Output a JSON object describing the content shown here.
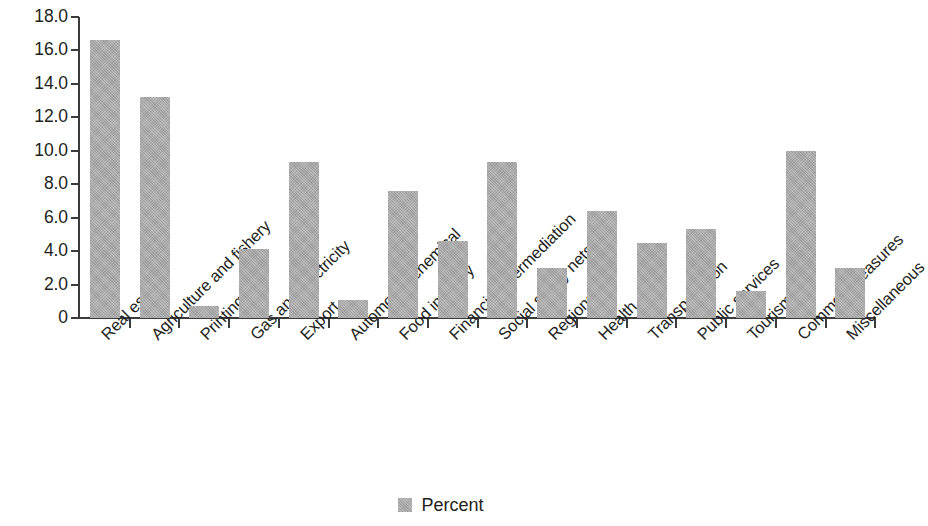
{
  "chart_data": {
    "type": "bar",
    "title": "",
    "subtitle": "",
    "xlabel": "",
    "ylabel": "",
    "ylim": [
      0,
      18
    ],
    "ytick_step": 2,
    "grid": false,
    "legend_position": "bottom-center",
    "bar_color": "#a9a9a9",
    "axis_color": "#3b3b3b",
    "text_color": "#231f20",
    "categories": [
      "Real estate",
      "Agriculture and fishery",
      "Printing",
      "Gas and electricity",
      "Export",
      "Automobile/chemical",
      "Food industry",
      "Financial intermediation",
      "Social safety nets",
      "Regions",
      "Health",
      "Transportation",
      "Public services",
      "Tourism",
      "Common measures",
      "Miscellaneous"
    ],
    "series": [
      {
        "name": "Percent",
        "values": [
          16.6,
          13.2,
          0.7,
          4.1,
          9.3,
          1.1,
          7.6,
          4.6,
          9.3,
          3.0,
          6.4,
          4.5,
          5.3,
          1.6,
          10.0,
          3.0
        ]
      }
    ],
    "ytick_labels": [
      "18.0",
      "16.0",
      "14.0",
      "12.0",
      "10.0",
      "8.0",
      "6.0",
      "4.0",
      "2.0",
      "0"
    ],
    "ytick_values": [
      18,
      16,
      14,
      12,
      10,
      8,
      6,
      4,
      2,
      0
    ],
    "legend": [
      {
        "label": "Percent",
        "color": "#a9a9a9",
        "swatch": "square-swatch"
      }
    ]
  }
}
